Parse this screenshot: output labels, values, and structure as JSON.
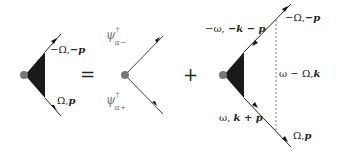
{
  "diagram": {
    "type": "feynman-vertex-equation",
    "operators": {
      "equals": "=",
      "plus": "+"
    },
    "left_vertex": {
      "upper_leg_label": {
        "freq": "−Ω,",
        "mom": "−p"
      },
      "lower_leg_label": {
        "freq": "Ω,",
        "mom": "p"
      }
    },
    "bare_vertex": {
      "upper_field": {
        "base": "ψ",
        "sup": "†",
        "sub": "α−"
      },
      "lower_field": {
        "base": "ψ",
        "sup": "†",
        "sub": "α+"
      }
    },
    "loop_vertex": {
      "upper_inner_label": {
        "freq": "−ω, ",
        "mom": "−k − p"
      },
      "upper_outer_label": {
        "freq": "−Ω,",
        "mom": "−p"
      },
      "interaction_label": {
        "freq": "ω − Ω,",
        "mom": "k"
      },
      "lower_inner_label": {
        "freq": "ω, ",
        "mom": "k + p"
      },
      "lower_outer_label": {
        "freq": "Ω,",
        "mom": "p"
      }
    },
    "colors": {
      "line": "#222222",
      "triangle": "#1a1a1a",
      "dot": "#777777",
      "dashed": "#555555"
    }
  }
}
